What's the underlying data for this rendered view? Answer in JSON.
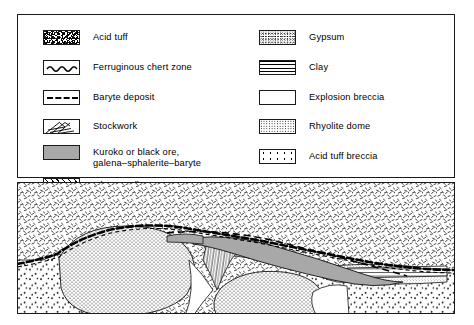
{
  "figure": {
    "type": "geological-cross-section"
  },
  "legend": {
    "left_column": [
      {
        "id": "acid-tuff",
        "pattern": "dense-irregular-speckle",
        "label": "Acid tuff"
      },
      {
        "id": "ferruginous-chert-zone",
        "pattern": "wavy-line",
        "label": "Ferruginous chert zone"
      },
      {
        "id": "baryte-deposit",
        "pattern": "dashed-line",
        "label": "Baryte deposit"
      },
      {
        "id": "stockwork",
        "pattern": "diagonal-veinlets",
        "label": "Stockwork"
      },
      {
        "id": "kuroko-black-ore",
        "pattern": "solid-grey",
        "label": "Kuroko or black ore,",
        "label2": "galena–sphalerite–baryte"
      },
      {
        "id": "oko-yellow-ore",
        "pattern": "diagonal-hatch",
        "label": "Oko or yellow ore,",
        "label2": "pyrite–chalcopyrite"
      }
    ],
    "right_column": [
      {
        "id": "gypsum",
        "pattern": "fine-stipple",
        "label": "Gypsum"
      },
      {
        "id": "clay",
        "pattern": "horizontal-lines",
        "label": "Clay"
      },
      {
        "id": "explosion-breccia",
        "pattern": "blank",
        "label": "Explosion breccia"
      },
      {
        "id": "rhyolite-dome",
        "pattern": "dense-dots",
        "label": "Rhyolite dome"
      },
      {
        "id": "acid-tuff-breccia",
        "pattern": "sparse-dots",
        "label": "Acid tuff breccia"
      }
    ]
  },
  "colors": {
    "ink": "#1a1a1a",
    "kuroko_grey": "#a8a8a8",
    "gypsum_grey": "#d8d8d8",
    "background": "#ffffff"
  },
  "cross_section": {
    "units": [
      {
        "id": "acid-tuff",
        "position": "upper-half overburden"
      },
      {
        "id": "ferruginous-chert-zone",
        "position": "undulating dashed horizon draped over dome and ore lens"
      },
      {
        "id": "baryte-deposit",
        "position": "thin dashed band above black ore"
      },
      {
        "id": "kuroko-black-ore",
        "position": "elongate lens dipping right from central vent"
      },
      {
        "id": "oko-yellow-ore",
        "position": "hatched wedge beneath black ore near vent"
      },
      {
        "id": "stockwork",
        "position": "funnel-shaped feeder zone below ore lens"
      },
      {
        "id": "gypsum",
        "position": "lenticular body at right end below ore"
      },
      {
        "id": "clay",
        "position": "thin banded wedge at right margin"
      },
      {
        "id": "rhyolite-dome",
        "position": "two large rounded dotted domes in lower half"
      },
      {
        "id": "acid-tuff-breccia",
        "position": "lower-left and lower-right margins"
      },
      {
        "id": "explosion-breccia",
        "position": "blank pockets between domes"
      }
    ]
  }
}
